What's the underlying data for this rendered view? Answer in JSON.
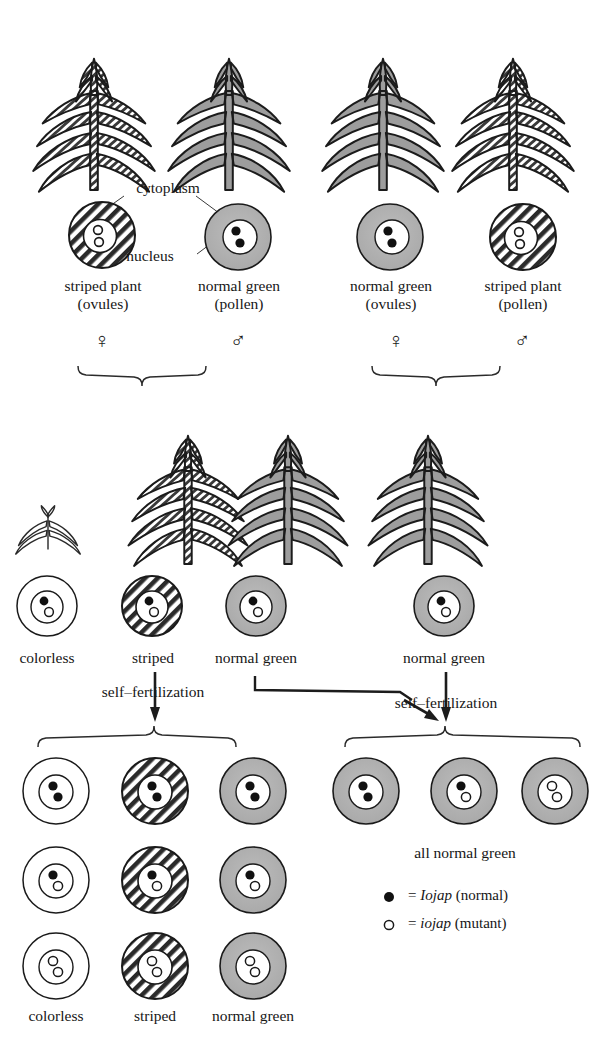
{
  "figure": {
    "colors": {
      "green_cytoplasm": "#b4b4b4",
      "outline": "#1a1a1a",
      "stripe_fill": "#c9c9c9",
      "colorless_cytoplasm": "#ffffff",
      "nucleus_fill": "#ffffff",
      "allele_normal": "#111111"
    }
  },
  "annotations": {
    "cytoplasm": "cytoplasm",
    "nucleus": "nucleus"
  },
  "crosses": [
    {
      "id": "cross-left",
      "parents": [
        {
          "id": "parent-striped-ovules",
          "plant": "striped",
          "label_line1": "striped plant",
          "label_line2": "(ovules)",
          "sex_symbol": "♀",
          "sex": "female",
          "cytoplasm": "striped",
          "alleles": [
            "mutant",
            "mutant"
          ]
        },
        {
          "id": "parent-normal-pollen",
          "plant": "normal green",
          "label_line1": "normal green",
          "label_line2": "(pollen)",
          "sex_symbol": "♂",
          "sex": "male",
          "cytoplasm": "green",
          "alleles": [
            "normal",
            "normal"
          ]
        }
      ],
      "offspring": [
        {
          "id": "f1-colorless",
          "label": "colorless",
          "cytoplasm": "colorless",
          "alleles": [
            "normal",
            "mutant"
          ],
          "plant": "colorless seedling"
        },
        {
          "id": "f1-striped",
          "label": "striped",
          "cytoplasm": "striped",
          "alleles": [
            "normal",
            "mutant"
          ],
          "plant": "striped"
        },
        {
          "id": "f1-normal-green",
          "label": "normal green",
          "cytoplasm": "green",
          "alleles": [
            "normal",
            "mutant"
          ],
          "plant": "normal green"
        }
      ],
      "self_fertilization_label": "self–fertilization",
      "f2_columns": [
        {
          "label": "colorless",
          "cytoplasm": "colorless"
        },
        {
          "label": "striped",
          "cytoplasm": "striped"
        },
        {
          "label": "normal green",
          "cytoplasm": "green"
        }
      ],
      "f2_rows": [
        [
          "normal",
          "normal"
        ],
        [
          "normal",
          "mutant"
        ],
        [
          "mutant",
          "mutant"
        ]
      ]
    },
    {
      "id": "cross-right",
      "parents": [
        {
          "id": "parent-normal-ovules",
          "plant": "normal green",
          "label_line1": "normal green",
          "label_line2": "(ovules)",
          "sex_symbol": "♀",
          "sex": "female",
          "cytoplasm": "green",
          "alleles": [
            "normal",
            "normal"
          ]
        },
        {
          "id": "parent-striped-pollen",
          "plant": "striped",
          "label_line1": "striped plant",
          "label_line2": "(pollen)",
          "sex_symbol": "♂",
          "sex": "male",
          "cytoplasm": "striped",
          "alleles": [
            "mutant",
            "mutant"
          ]
        }
      ],
      "offspring": [
        {
          "id": "f1-right-normal-green",
          "label": "normal green",
          "cytoplasm": "green",
          "alleles": [
            "normal",
            "mutant"
          ],
          "plant": "normal green"
        }
      ],
      "self_fertilization_label": "self–fertilization",
      "f2_label": "all normal green",
      "f2_cells": [
        {
          "cytoplasm": "green",
          "alleles": [
            "normal",
            "normal"
          ]
        },
        {
          "cytoplasm": "green",
          "alleles": [
            "normal",
            "mutant"
          ]
        },
        {
          "cytoplasm": "green",
          "alleles": [
            "mutant",
            "mutant"
          ]
        }
      ]
    }
  ],
  "legend": {
    "items": [
      {
        "marker": "filled",
        "equals": "=",
        "gene": "Iojap",
        "note": "(normal)"
      },
      {
        "marker": "hollow",
        "equals": "=",
        "gene": "iojap",
        "note": "(mutant)"
      }
    ]
  }
}
